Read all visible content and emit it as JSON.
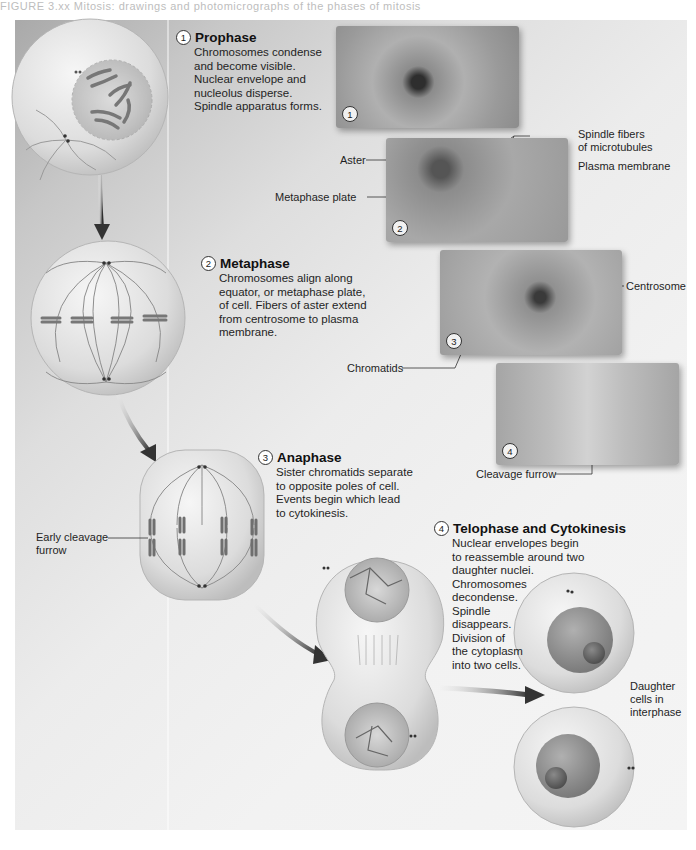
{
  "header": {
    "caption_fragment": "FIGURE 3.xx  Mitosis: drawings and photomicrographs of the phases of mitosis"
  },
  "colors": {
    "panel_dark": "#a9a9a9",
    "panel_light": "#f4f4f4",
    "cell_fill": "#e4e4e4",
    "chromosome": "#7a7a7a",
    "arrow": "#3a3a3a",
    "nucleus": "#8e8e8e"
  },
  "phases": [
    {
      "number": "1",
      "title": "Prophase",
      "description": "Chromosomes condense\nand become visible.\nNuclear envelope and\nnucleolus disperse.\nSpindle apparatus forms."
    },
    {
      "number": "2",
      "title": "Metaphase",
      "description": "Chromosomes align along\nequator, or metaphase plate,\nof cell. Fibers of aster extend\nfrom centrosome to plasma\nmembrane."
    },
    {
      "number": "3",
      "title": "Anaphase",
      "description": "Sister chromatids separate\nto opposite poles of cell.\nEvents begin which lead\nto cytokinesis."
    },
    {
      "number": "4",
      "title": "Telophase and Cytokinesis",
      "description": "Nuclear envelopes begin\nto reassemble around two\ndaughter nuclei.\nChromosomes\ndecondense.\nSpindle\ndisappears.\nDivision of\nthe cytoplasm\ninto two cells."
    }
  ],
  "micrographs": [
    {
      "number": "1"
    },
    {
      "number": "2"
    },
    {
      "number": "3"
    },
    {
      "number": "4"
    }
  ],
  "labels": {
    "spindle_fibers": "Spindle fibers\nof microtubules",
    "aster": "Aster",
    "plasma_membrane": "Plasma membrane",
    "metaphase_plate": "Metaphase plate",
    "centrosome": "Centrosome",
    "chromatids": "Chromatids",
    "cleavage_furrow": "Cleavage furrow",
    "early_cleavage_furrow": "Early cleavage\nfurrow",
    "daughter_cells": "Daughter\ncells in\ninterphase"
  }
}
